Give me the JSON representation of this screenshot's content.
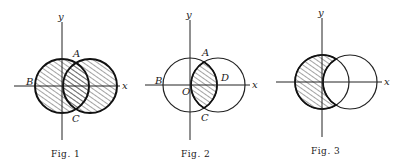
{
  "figures": [
    {
      "caption": "Fig. 1",
      "description": "Union of two overlapping circles shaded",
      "labels": {
        "y": "y",
        "x": "x",
        "A": "A",
        "B": "B",
        "C": "C"
      }
    },
    {
      "caption": "Fig. 2",
      "description": "Intersection (lens) of two overlapping circles shaded",
      "labels": {
        "y": "y",
        "x": "x",
        "A": "A",
        "B": "B",
        "C": "C",
        "D": "D",
        "O": "O"
      }
    },
    {
      "caption": "Fig. 3",
      "description": "Left circle minus right circle shaded (crescent)",
      "labels": {
        "y": "y",
        "x": "x"
      }
    }
  ],
  "colors": {
    "ink": "#222222",
    "background": "#ffffff"
  }
}
